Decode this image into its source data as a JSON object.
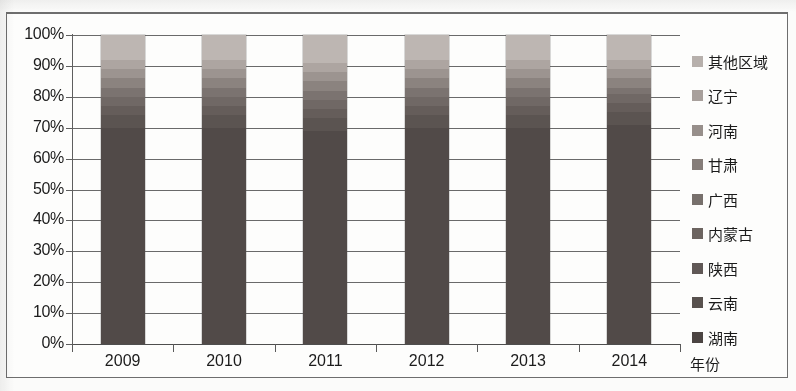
{
  "chart_data": {
    "type": "bar",
    "subtype": "100% stacked bar",
    "title": "",
    "xlabel": "年份",
    "ylabel": "",
    "ylim": [
      0,
      100
    ],
    "grid": true,
    "legend_position": "right",
    "categories": [
      "2009",
      "2010",
      "2011",
      "2012",
      "2013",
      "2014"
    ],
    "ytick_labels": [
      "0%",
      "10%",
      "20%",
      "30%",
      "40%",
      "50%",
      "60%",
      "70%",
      "80%",
      "90%",
      "100%"
    ],
    "ytick_values": [
      0,
      10,
      20,
      30,
      40,
      50,
      60,
      70,
      80,
      90,
      100
    ],
    "series": [
      {
        "name": "湖南",
        "color": "#514a48",
        "values": [
          70,
          70,
          69,
          70,
          70,
          71
        ]
      },
      {
        "name": "云南",
        "color": "#5b5451",
        "values": [
          4,
          4,
          4,
          4,
          4,
          4
        ]
      },
      {
        "name": "陕西",
        "color": "#655d5a",
        "values": [
          3,
          3,
          3,
          3,
          3,
          3
        ]
      },
      {
        "name": "内蒙古",
        "color": "#706865",
        "values": [
          3,
          3,
          3,
          3,
          3,
          3
        ]
      },
      {
        "name": "广西",
        "color": "#7b7370",
        "values": [
          3,
          3,
          3,
          3,
          3,
          2
        ]
      },
      {
        "name": "甘肃",
        "color": "#8b837f",
        "values": [
          3,
          3,
          3,
          3,
          3,
          3
        ]
      },
      {
        "name": "河南",
        "color": "#9c9490",
        "values": [
          3,
          3,
          3,
          3,
          3,
          3
        ]
      },
      {
        "name": "辽宁",
        "color": "#ada5a1",
        "values": [
          3,
          3,
          3,
          3,
          3,
          3
        ]
      },
      {
        "name": "其他区域",
        "color": "#bdb6b2",
        "values": [
          8,
          8,
          9,
          8,
          8,
          8
        ]
      }
    ]
  },
  "legend": {
    "items": [
      {
        "label": "其他区域",
        "color": "#b7b0ac"
      },
      {
        "label": "辽宁",
        "color": "#a8a09c"
      },
      {
        "label": "河南",
        "color": "#978f8b"
      },
      {
        "label": "甘肃",
        "color": "#857d79"
      },
      {
        "label": "广西",
        "color": "#77706c"
      },
      {
        "label": "内蒙古",
        "color": "#6c6460"
      },
      {
        "label": "陕西",
        "color": "#605856"
      },
      {
        "label": "云南",
        "color": "#58514e"
      },
      {
        "label": "湖南",
        "color": "#4b4442"
      }
    ]
  }
}
